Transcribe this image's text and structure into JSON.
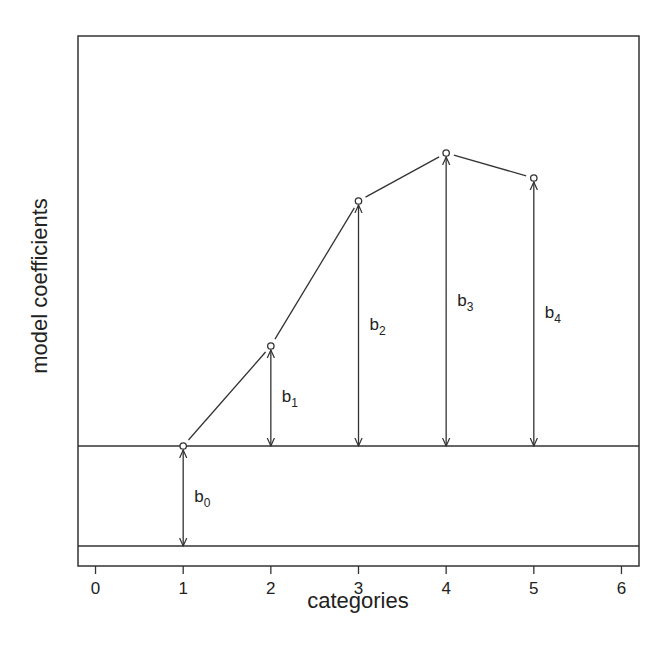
{
  "chart_data": {
    "type": "line",
    "title": "",
    "xlabel": "categories",
    "ylabel": "model coefficients",
    "xlim": [
      -0.2,
      6.2
    ],
    "ylim": [
      -0.2,
      5.1
    ],
    "xticks": [
      0,
      1,
      2,
      3,
      4,
      5,
      6
    ],
    "xtick_labels": [
      "0",
      "1",
      "2",
      "3",
      "4",
      "5",
      "6"
    ],
    "yticks": [],
    "grid": false,
    "legend": "none",
    "series": [
      {
        "name": "category means",
        "x": [
          1,
          2,
          3,
          4,
          5
        ],
        "y": [
          1.0,
          2.0,
          3.45,
          3.93,
          3.68
        ],
        "marker": "open-circle"
      }
    ],
    "reference_lines": [
      {
        "name": "zero baseline",
        "y": 0
      },
      {
        "name": "intercept level",
        "y": 1.0
      }
    ],
    "coefficients": [
      {
        "label": "b",
        "sub": "0",
        "x": 1,
        "from": 0,
        "to": 1.0,
        "value": 1.0
      },
      {
        "label": "b",
        "sub": "1",
        "x": 2,
        "from": 1.0,
        "to": 2.0,
        "value": 1.0
      },
      {
        "label": "b",
        "sub": "2",
        "x": 3,
        "from": 1.0,
        "to": 3.45,
        "value": 2.45
      },
      {
        "label": "b",
        "sub": "3",
        "x": 4,
        "from": 1.0,
        "to": 3.93,
        "value": 2.93
      },
      {
        "label": "b",
        "sub": "4",
        "x": 5,
        "from": 1.0,
        "to": 3.68,
        "value": 2.68
      }
    ],
    "colors": {
      "ink": "#333333",
      "background": "#ffffff"
    }
  }
}
